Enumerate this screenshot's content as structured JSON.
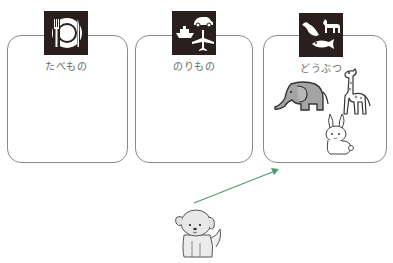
{
  "categories": [
    {
      "id": "food",
      "label": "たべもの",
      "icon": "plate-fork-knife-icon",
      "items": []
    },
    {
      "id": "vehicles",
      "label": "のりもの",
      "icon": "car-ship-plane-icon",
      "items": []
    },
    {
      "id": "animals",
      "label": "どうぶつ",
      "icon": "bird-dog-fish-icon",
      "items": [
        "elephant",
        "giraffe",
        "rabbit"
      ]
    }
  ],
  "draggable_item": {
    "name": "dog"
  },
  "arrow": {
    "color": "#4e9a6e",
    "from": "dog",
    "to": "animals"
  },
  "colors": {
    "icon_bg": "#2a1f1c",
    "box_border": "#8a8a8a",
    "label_text": "#6a6a6a"
  }
}
